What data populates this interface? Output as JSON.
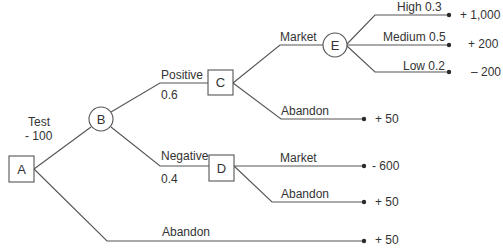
{
  "diagram": {
    "type": "decision-tree",
    "colors": {
      "line": "#555555",
      "text": "#333333",
      "dot": "#2a2a2a",
      "background": "#ffffff"
    },
    "nodes": [
      {
        "id": "A",
        "shape": "square",
        "label": "A"
      },
      {
        "id": "B",
        "shape": "circle",
        "label": "B"
      },
      {
        "id": "C",
        "shape": "square",
        "label": "C"
      },
      {
        "id": "D",
        "shape": "square",
        "label": "D"
      },
      {
        "id": "E",
        "shape": "circle",
        "label": "E"
      }
    ],
    "edges": {
      "a_test": {
        "label": "Test",
        "cost": "- 100"
      },
      "b_positive": {
        "label": "Positive",
        "probability": "0.6"
      },
      "b_negative": {
        "label": "Negative",
        "probability": "0.4"
      },
      "c_market": {
        "label": "Market"
      },
      "c_abandon": {
        "label": "Abandon",
        "payoff": "+ 50"
      },
      "e_high": {
        "label": "High  0.3",
        "payoff": "+ 1,000"
      },
      "e_medium": {
        "label": "Medium 0.5",
        "payoff": "+ 200"
      },
      "e_low": {
        "label": "Low 0.2",
        "payoff": "– 200"
      },
      "d_market": {
        "label": "Market",
        "payoff": "- 600"
      },
      "d_abandon": {
        "label": "Abandon",
        "payoff": "+ 50"
      },
      "a_abandon": {
        "label": "Abandon",
        "payoff": "+ 50"
      }
    }
  }
}
